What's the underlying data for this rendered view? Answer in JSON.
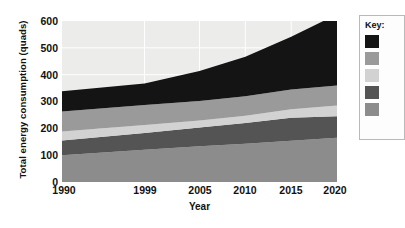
{
  "chart_data": {
    "type": "area",
    "title": "",
    "xlabel": "Year",
    "ylabel": "Total energy consumption (quads)",
    "stacked": true,
    "grid": true,
    "legend_position": "right",
    "legend_title": "Key:",
    "x": [
      1990,
      1999,
      2005,
      2010,
      2015,
      2020
    ],
    "xtick_labels": [
      "1990",
      "1999",
      "2005",
      "2010",
      "2015",
      "2020"
    ],
    "ytick_labels": [
      "0",
      "100",
      "200",
      "300",
      "400",
      "500",
      "600"
    ],
    "yticks": [
      0,
      100,
      200,
      300,
      400,
      500,
      600
    ],
    "xlim": [
      1990,
      2020
    ],
    "ylim": [
      0,
      600
    ],
    "series": [
      {
        "name": "series-1",
        "color": "#8c8c8c",
        "values": [
          100,
          120,
          133,
          143,
          154,
          165
        ]
      },
      {
        "name": "series-2",
        "color": "#545454",
        "values": [
          55,
          63,
          70,
          77,
          85,
          80
        ]
      },
      {
        "name": "series-3",
        "color": "#d2d2d2",
        "values": [
          33,
          29,
          26,
          27,
          32,
          40
        ]
      },
      {
        "name": "series-4",
        "color": "#9a9a9a",
        "values": [
          75,
          75,
          73,
          73,
          74,
          75
        ]
      },
      {
        "name": "series-5",
        "color": "#141414",
        "values": [
          75,
          80,
          112,
          147,
          196,
          265
        ]
      }
    ],
    "cumulative_tops": {
      "series-1": [
        100,
        120,
        133,
        143,
        154,
        165
      ],
      "series-2": [
        155,
        183,
        203,
        220,
        239,
        245
      ],
      "series-3": [
        188,
        212,
        229,
        247,
        271,
        285
      ],
      "series-4": [
        263,
        287,
        302,
        320,
        345,
        360
      ],
      "series-5": [
        338,
        367,
        414,
        467,
        541,
        625
      ]
    }
  },
  "legend": {
    "title": "Key:",
    "items": [
      {
        "name": "legend-swatch-1",
        "color": "#141414"
      },
      {
        "name": "legend-swatch-2",
        "color": "#9a9a9a"
      },
      {
        "name": "legend-swatch-3",
        "color": "#d2d2d2"
      },
      {
        "name": "legend-swatch-4",
        "color": "#545454"
      },
      {
        "name": "legend-swatch-5",
        "color": "#8c8c8c"
      }
    ]
  }
}
